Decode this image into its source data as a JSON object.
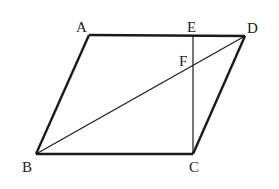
{
  "diagram": {
    "points": {
      "A": {
        "label": "A",
        "x": 89,
        "y": 35
      },
      "B": {
        "label": "B",
        "x": 36,
        "y": 154
      },
      "C": {
        "label": "C",
        "x": 193,
        "y": 154
      },
      "D": {
        "label": "D",
        "x": 245,
        "y": 36
      },
      "E": {
        "label": "E",
        "x": 193,
        "y": 35
      },
      "F": {
        "label": "F",
        "x": 193,
        "y": 66
      }
    },
    "segments": [
      {
        "from": "A",
        "to": "D",
        "style": "thick"
      },
      {
        "from": "D",
        "to": "C",
        "style": "thick"
      },
      {
        "from": "C",
        "to": "B",
        "style": "thick"
      },
      {
        "from": "B",
        "to": "A",
        "style": "thick"
      },
      {
        "from": "B",
        "to": "D",
        "style": "thin"
      },
      {
        "from": "E",
        "to": "C",
        "style": "thin"
      }
    ],
    "colors": {
      "line": "#1a1a1a",
      "text": "#222222"
    }
  }
}
